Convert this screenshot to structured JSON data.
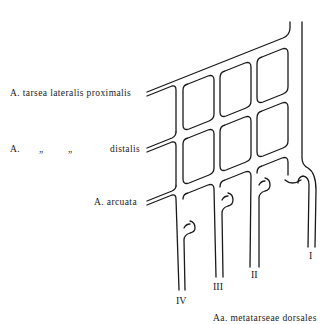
{
  "figure": {
    "labels": {
      "tarsea_proximalis": "A. tarsea lateralis proximalis",
      "distalis_prefix": "A.",
      "ditto_1": "„",
      "ditto_2": "„",
      "distalis": "distalis",
      "arcuata": "A. arcuata",
      "metatarseae": "Aa. metatarseae dorsales"
    },
    "vessels": {
      "I": "I",
      "II": "II",
      "III": "III",
      "IV": "IV"
    }
  }
}
